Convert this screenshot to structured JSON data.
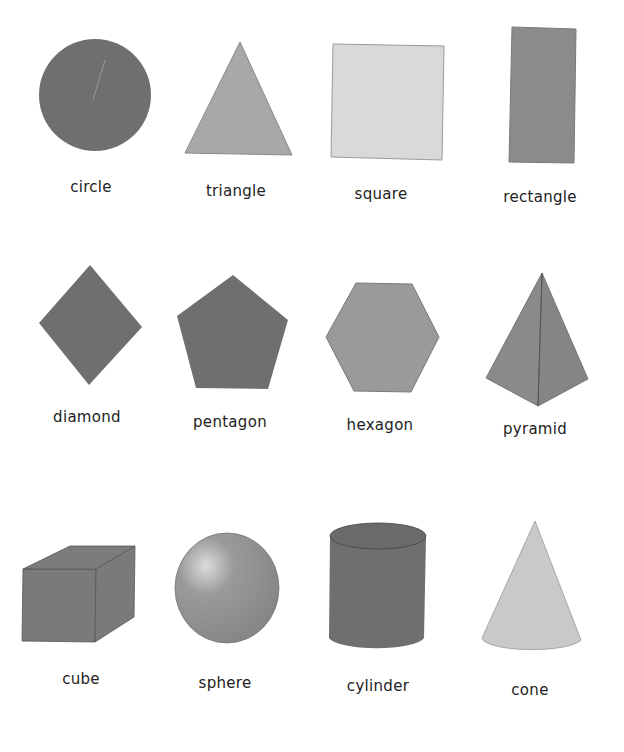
{
  "colors": {
    "dark_gray": "#6e6e6e",
    "mid_gray": "#8a8a8a",
    "light_gray": "#c8c8c8",
    "pale_gray": "#d9d9d9",
    "outline": "#555555",
    "label_text": "#222222",
    "background": "#ffffff"
  },
  "shapes": [
    {
      "id": "circle",
      "label": "circle",
      "label_x": 91,
      "label_y": 178
    },
    {
      "id": "triangle",
      "label": "triangle",
      "label_x": 236,
      "label_y": 182
    },
    {
      "id": "square",
      "label": "square",
      "label_x": 381,
      "label_y": 185
    },
    {
      "id": "rectangle",
      "label": "rectangle",
      "label_x": 540,
      "label_y": 188
    },
    {
      "id": "diamond",
      "label": "diamond",
      "label_x": 87,
      "label_y": 408
    },
    {
      "id": "pentagon",
      "label": "pentagon",
      "label_x": 230,
      "label_y": 413
    },
    {
      "id": "hexagon",
      "label": "hexagon",
      "label_x": 380,
      "label_y": 416
    },
    {
      "id": "pyramid",
      "label": "pyramid",
      "label_x": 535,
      "label_y": 420
    },
    {
      "id": "cube",
      "label": "cube",
      "label_x": 81,
      "label_y": 670
    },
    {
      "id": "sphere",
      "label": "sphere",
      "label_x": 225,
      "label_y": 674
    },
    {
      "id": "cylinder",
      "label": "cylinder",
      "label_x": 378,
      "label_y": 677
    },
    {
      "id": "cone",
      "label": "cone",
      "label_x": 530,
      "label_y": 681
    }
  ]
}
